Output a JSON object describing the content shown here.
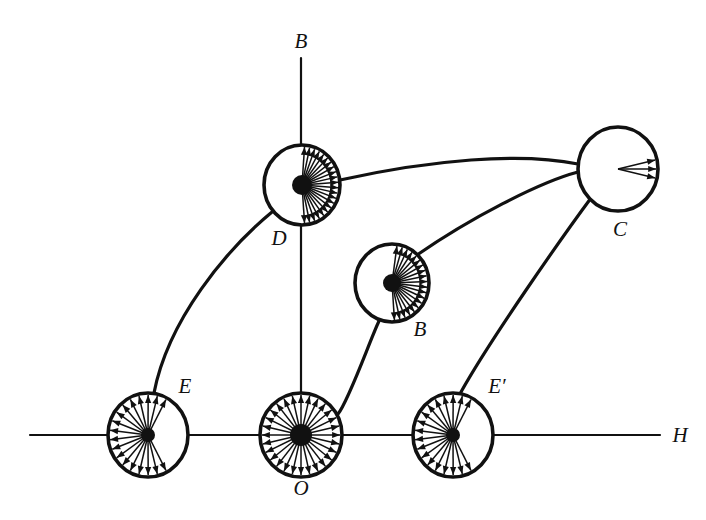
{
  "figure": {
    "background_color": "#ffffff",
    "ink_color": "#111111",
    "width": 706,
    "height": 520
  },
  "axes": {
    "vertical": {
      "label": "B",
      "label_x": 301,
      "label_y": 48,
      "x": 301,
      "y_top": 58,
      "y_bottom": 446
    },
    "horizontal": {
      "label": "H",
      "label_x": 680,
      "label_y": 442,
      "y": 435,
      "x_left": 30,
      "x_right": 660
    }
  },
  "nodes": [
    {
      "id": "O",
      "label": "O",
      "label_x": 301,
      "label_y": 495,
      "cx": 301,
      "cy": 435,
      "rx": 41,
      "ry": 42,
      "arrow_count": 28,
      "arrow_start_deg": 0,
      "arrow_span_deg": 360,
      "hub_radius": 11,
      "description": "demagnetized: domains point in all directions"
    },
    {
      "id": "E",
      "label": "E",
      "label_x": 185,
      "label_y": 393,
      "cx": 148,
      "cy": 435,
      "rx": 40,
      "ry": 42,
      "arrow_count": 18,
      "arrow_start_deg": 62,
      "arrow_span_deg": 236,
      "hub_radius": 7,
      "description": "low field: domains biased left / up / down"
    },
    {
      "id": "E'",
      "label": "E′",
      "label_x": 497,
      "label_y": 393,
      "cx": 453,
      "cy": 435,
      "rx": 40,
      "ry": 42,
      "arrow_count": 18,
      "arrow_start_deg": 62,
      "arrow_span_deg": 236,
      "hub_radius": 7,
      "description": "reverse low field: domains biased left / up / down"
    },
    {
      "id": "B",
      "label": "B",
      "label_x": 420,
      "label_y": 336,
      "cx": 392,
      "cy": 283,
      "rx": 37,
      "ry": 39,
      "arrow_count": 20,
      "arrow_start_deg": -82,
      "arrow_span_deg": 168,
      "hub_radius": 9,
      "description": "rising field: domains rotate toward the field direction"
    },
    {
      "id": "D",
      "label": "D",
      "label_x": 279,
      "label_y": 245,
      "cx": 302,
      "cy": 185,
      "rx": 38,
      "ry": 40,
      "arrow_count": 22,
      "arrow_start_deg": -86,
      "arrow_span_deg": 172,
      "hub_radius": 10,
      "description": "near knee: most domains aligned with the field"
    },
    {
      "id": "C",
      "label": "C",
      "label_x": 620,
      "label_y": 236,
      "cx": 618,
      "cy": 169,
      "rx": 40,
      "ry": 42,
      "arrow_count": 3,
      "arrow_start_deg": -13,
      "arrow_span_deg": 26,
      "hub_radius": 0,
      "description": "saturation: all domains aligned with the field"
    }
  ],
  "connectors": [
    {
      "id": "E-to-D",
      "from": "E",
      "to": "D",
      "path": "M 154 393 C 168 320 226 250 272 212"
    },
    {
      "id": "O-to-B",
      "from": "O",
      "to": "B",
      "path": "M 338 414 C 349 400 370 340 379 321"
    },
    {
      "id": "B-to-C",
      "from": "B",
      "to": "C",
      "path": "M 414 257 C 470 218 540 182 578 172"
    },
    {
      "id": "D-to-C",
      "from": "D",
      "to": "C",
      "path": "M 340 180 C 430 160 520 152 578 164"
    },
    {
      "id": "Eprime-to-C",
      "from": "E'",
      "to": "C",
      "path": "M 461 392 C 490 340 560 240 591 198"
    }
  ],
  "legend_note": "Each circle shows the instantaneous domain / spin orientation at that point on the magnetization curve."
}
